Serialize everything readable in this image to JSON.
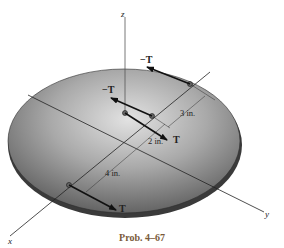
{
  "figure": {
    "caption": "Prob. 4–67",
    "axes": {
      "x": "x",
      "y": "y",
      "z": "z"
    },
    "forces": [
      {
        "label": "−T",
        "position": "top-right point"
      },
      {
        "label": "−T",
        "position": "mid point"
      },
      {
        "label": "T",
        "position": "center (origin)"
      },
      {
        "label": "T",
        "position": "lower point on x-axis"
      }
    ],
    "dimensions": [
      {
        "label": "3 in."
      },
      {
        "label": "2 in."
      },
      {
        "label": "4 in."
      }
    ],
    "colors": {
      "disk_light": "#d8d8d8",
      "disk_dark": "#5a5a5a",
      "rim": "#3a3a3a",
      "caption": "#7a5a3a"
    }
  }
}
